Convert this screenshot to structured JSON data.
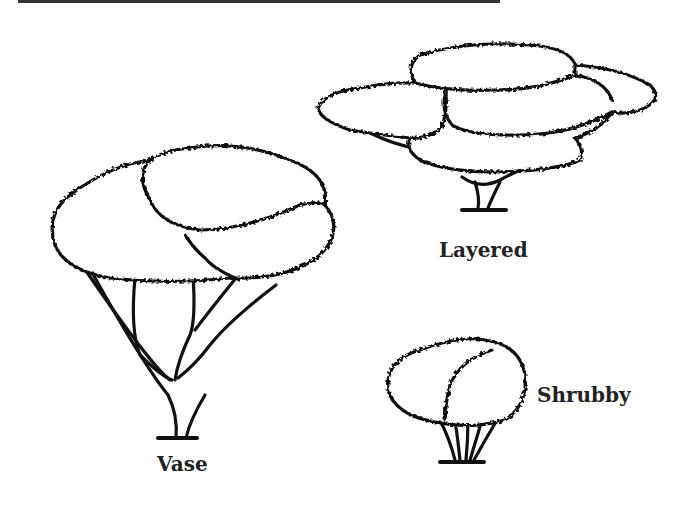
{
  "figure": {
    "labels": {
      "vase": "Vase",
      "layered": "Layered",
      "shrubby": "Shrubby"
    },
    "trees": [
      {
        "id": "vase",
        "shape": "tall tree with large rounded canopy and branching trunks"
      },
      {
        "id": "layered",
        "shape": "wide tree with horizontal layered canopy"
      },
      {
        "id": "shrubby",
        "shape": "short rounded bush with multiple stems"
      }
    ]
  }
}
